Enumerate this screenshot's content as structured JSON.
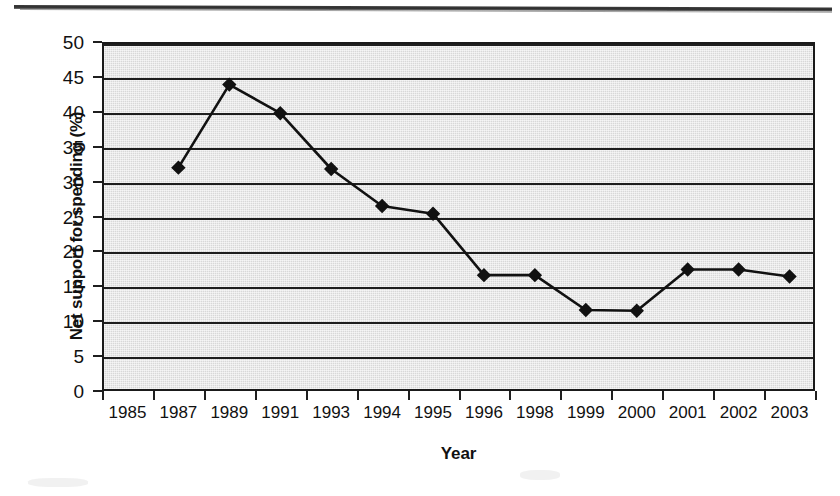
{
  "figure": {
    "y_axis_title": "Net support for spending (%)",
    "x_axis_title": "Year"
  },
  "chart_data": {
    "type": "line",
    "title": "",
    "xlabel": "Year",
    "ylabel": "Net support for spending (%)",
    "categories": [
      "1985",
      "1987",
      "1989",
      "1991",
      "1993",
      "1994",
      "1995",
      "1996",
      "1998",
      "1999",
      "2000",
      "2001",
      "2002",
      "2003"
    ],
    "values": [
      null,
      32.0,
      43.9,
      39.8,
      31.8,
      26.5,
      25.4,
      16.6,
      16.6,
      11.6,
      11.5,
      17.4,
      17.4,
      16.4
    ],
    "ylim": [
      0,
      50
    ],
    "ytick_step": 5,
    "yticks": [
      "50",
      "45",
      "40",
      "35",
      "30",
      "25",
      "20",
      "15",
      "10",
      "5",
      "0"
    ],
    "grid": "horizontal",
    "legend": "none",
    "marker": "diamond",
    "marker_color": "#111111",
    "line_color": "#111111",
    "plot_background": "#d8d8d8",
    "series": [
      {
        "name": "Net support for spending",
        "points": [
          {
            "x": "1985",
            "y": null
          },
          {
            "x": "1987",
            "y": 32.0
          },
          {
            "x": "1989",
            "y": 43.9
          },
          {
            "x": "1991",
            "y": 39.8
          },
          {
            "x": "1993",
            "y": 31.8
          },
          {
            "x": "1994",
            "y": 26.5
          },
          {
            "x": "1995",
            "y": 25.4
          },
          {
            "x": "1996",
            "y": 16.6
          },
          {
            "x": "1998",
            "y": 16.6
          },
          {
            "x": "1999",
            "y": 11.6
          },
          {
            "x": "2000",
            "y": 11.5
          },
          {
            "x": "2001",
            "y": 17.4
          },
          {
            "x": "2002",
            "y": 17.4
          },
          {
            "x": "2003",
            "y": 16.4
          }
        ]
      }
    ]
  }
}
